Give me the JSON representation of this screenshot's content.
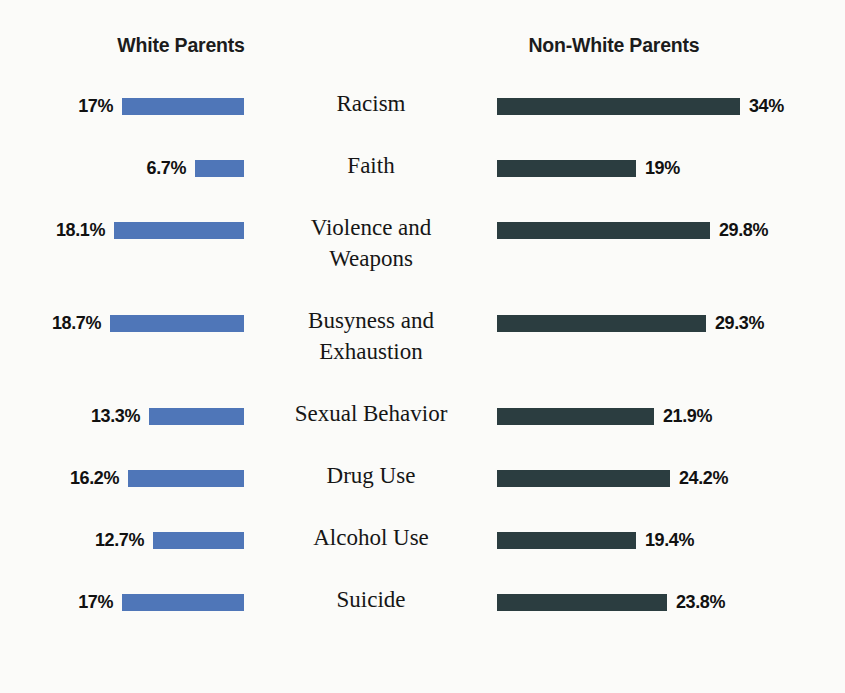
{
  "headers": {
    "left": "White Parents",
    "right": "Non-White Parents"
  },
  "chart_data": {
    "type": "bar",
    "title": "",
    "subtitle": "",
    "xlabel": "",
    "ylabel": "",
    "orientation": "horizontal",
    "layout": "diverging-paired",
    "grid": false,
    "legend_position": "top",
    "xlim": [
      0,
      34
    ],
    "units": "percent",
    "px_per_percent": 7.15,
    "categories": [
      "Racism",
      "Faith",
      "Violence and Weapons",
      "Busyness and Exhaustion",
      "Sexual Behavior",
      "Drug Use",
      "Alcohol Use",
      "Suicide"
    ],
    "series": [
      {
        "name": "White Parents",
        "color": "#4f76b8",
        "side": "left",
        "values": [
          17,
          6.7,
          18.1,
          18.7,
          13.3,
          16.2,
          12.7,
          17
        ],
        "labels": [
          "17%",
          "6.7%",
          "18.1%",
          "18.7%",
          "13.3%",
          "16.2%",
          "12.7%",
          "17%"
        ]
      },
      {
        "name": "Non-White Parents",
        "color": "#2b3d40",
        "side": "right",
        "values": [
          34,
          19,
          29.8,
          29.3,
          21.9,
          24.2,
          19.4,
          23.8
        ],
        "labels": [
          "34%",
          "19%",
          "29.8%",
          "29.3%",
          "21.9%",
          "24.2%",
          "19.4%",
          "23.8%"
        ]
      }
    ]
  },
  "rows": [
    {
      "label_lines": [
        "Racism"
      ],
      "left_value": "17%",
      "left_pct": 17,
      "left_px": 122,
      "right_value": "34%",
      "right_pct": 34,
      "right_px": 243,
      "height": 62
    },
    {
      "label_lines": [
        "Faith"
      ],
      "left_value": "6.7%",
      "left_pct": 6.7,
      "left_px": 49,
      "right_value": "19%",
      "right_pct": 19,
      "right_px": 139,
      "height": 62
    },
    {
      "label_lines": [
        "Violence and",
        "Weapons"
      ],
      "left_value": "18.1%",
      "left_pct": 18.1,
      "left_px": 130,
      "right_value": "29.8%",
      "right_pct": 29.8,
      "right_px": 213,
      "height": 93
    },
    {
      "label_lines": [
        "Busyness and",
        "Exhaustion"
      ],
      "left_value": "18.7%",
      "left_pct": 18.7,
      "left_px": 134,
      "right_value": "29.3%",
      "right_pct": 29.3,
      "right_px": 209,
      "height": 93
    },
    {
      "label_lines": [
        "Sexual Behavior"
      ],
      "left_value": "13.3%",
      "left_pct": 13.3,
      "left_px": 95,
      "right_value": "21.9%",
      "right_pct": 21.9,
      "right_px": 157,
      "height": 62
    },
    {
      "label_lines": [
        "Drug Use"
      ],
      "left_value": "16.2%",
      "left_pct": 16.2,
      "left_px": 116,
      "right_value": "24.2%",
      "right_pct": 24.2,
      "right_px": 173,
      "height": 62
    },
    {
      "label_lines": [
        "Alcohol Use"
      ],
      "left_value": "12.7%",
      "left_pct": 12.7,
      "left_px": 91,
      "right_value": "19.4%",
      "right_pct": 19.4,
      "right_px": 139,
      "height": 62
    },
    {
      "label_lines": [
        "Suicide"
      ],
      "left_value": "17%",
      "left_pct": 17,
      "left_px": 122,
      "right_value": "23.8%",
      "right_pct": 23.8,
      "right_px": 170,
      "height": 62
    }
  ],
  "colors": {
    "left_bar": "#4f76b8",
    "right_bar": "#2b3d40",
    "background": "#fbfbf9",
    "text": "#161616"
  }
}
